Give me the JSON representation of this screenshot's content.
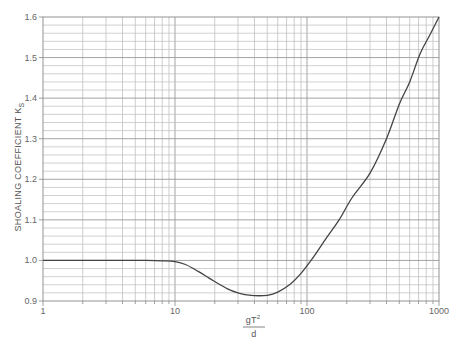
{
  "chart_data": {
    "type": "line",
    "title": "",
    "xlabel": "gT²/d",
    "xlabel_parts": {
      "numerator": "gT",
      "superscript": "2",
      "denominator": "d"
    },
    "ylabel": "SHOALING COEFFICIENT K",
    "ylabel_subscript": "S",
    "xscale": "log",
    "xlim": [
      1,
      1000
    ],
    "ylim": [
      0.9,
      1.6
    ],
    "x_ticks": [
      1,
      10,
      100,
      1000
    ],
    "x_tick_labels": [
      "1",
      "10",
      "100",
      "1000"
    ],
    "y_ticks": [
      0.9,
      1.0,
      1.1,
      1.2,
      1.3,
      1.4,
      1.5,
      1.6
    ],
    "y_tick_labels": [
      "0.9",
      "1.0",
      "1.1",
      "1.2",
      "1.3",
      "1.4",
      "1.5",
      "1.6"
    ],
    "grid": {
      "x": "log minor (2-9 per decade)",
      "y_minor_step": 0.02
    },
    "legend": null,
    "series": [
      {
        "name": "Ks",
        "x": [
          1,
          2,
          4,
          6,
          8,
          10,
          12,
          15,
          18,
          20,
          25,
          30,
          35,
          40,
          50,
          60,
          75,
          90,
          110,
          140,
          175,
          220,
          300,
          400,
          500,
          600,
          720,
          850,
          1000
        ],
        "y": [
          1.0,
          1.0,
          1.0,
          1.0,
          0.999,
          0.997,
          0.99,
          0.973,
          0.957,
          0.948,
          0.93,
          0.92,
          0.915,
          0.913,
          0.914,
          0.922,
          0.942,
          0.968,
          1.005,
          1.055,
          1.1,
          1.155,
          1.215,
          1.3,
          1.385,
          1.44,
          1.51,
          1.555,
          1.6
        ]
      }
    ]
  }
}
